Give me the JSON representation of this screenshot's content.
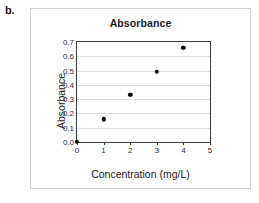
{
  "figure": {
    "label": "b."
  },
  "chart_data": {
    "type": "scatter",
    "title": "Absorbance",
    "xlabel": "Concentration (mg/L)",
    "ylabel": "Absorbance",
    "xlim": [
      0,
      5
    ],
    "ylim": [
      0,
      0.7
    ],
    "grid": true,
    "legend": null,
    "x_ticks": [
      "0",
      "1",
      "2",
      "3",
      "4",
      "5"
    ],
    "x_tick_values": [
      0,
      1,
      2,
      3,
      4,
      5
    ],
    "y_ticks": [
      "0.0",
      "0.1",
      "0.2",
      "0.3",
      "0.4",
      "0.5",
      "0.6",
      "0.7"
    ],
    "y_tick_values": [
      0.0,
      0.1,
      0.2,
      0.3,
      0.4,
      0.5,
      0.6,
      0.7
    ],
    "x": [
      0,
      1,
      2,
      3,
      4
    ],
    "values": [
      0.0,
      0.16,
      0.33,
      0.49,
      0.66
    ],
    "marker_color": "#000000",
    "gridline_color": "#dcdcdc",
    "axis_color": "#3c3c3c"
  }
}
